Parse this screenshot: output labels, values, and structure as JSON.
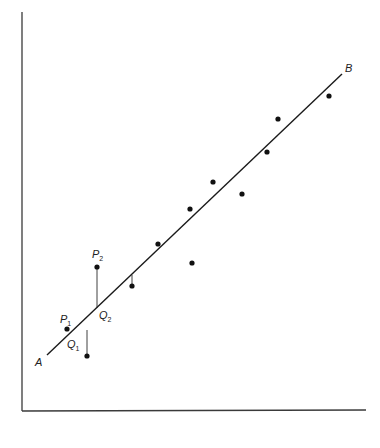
{
  "diagram": {
    "type": "scatter-with-regression-line",
    "axes": {
      "origin": [
        22,
        411
      ],
      "y_top": [
        22,
        12
      ],
      "x_right": [
        366,
        411
      ]
    },
    "line": {
      "start": {
        "label": "A",
        "x": 47,
        "y": 355
      },
      "end": {
        "label": "B",
        "x": 342,
        "y": 74
      }
    },
    "labels": {
      "A": "A",
      "B": "B",
      "P1": {
        "main": "P",
        "sub": "1"
      },
      "P2": {
        "main": "P",
        "sub": "2"
      },
      "Q1": {
        "main": "Q",
        "sub": "1"
      },
      "Q2": {
        "main": "Q",
        "sub": "2"
      }
    },
    "points": [
      {
        "name": "P1",
        "x": 67,
        "y": 329
      },
      {
        "name": "below-Q1",
        "x": 87,
        "y": 356
      },
      {
        "name": "P2",
        "x": 97,
        "y": 267
      },
      {
        "name": "pt-4",
        "x": 132,
        "y": 286
      },
      {
        "name": "pt-5",
        "x": 158,
        "y": 244
      },
      {
        "name": "pt-6",
        "x": 190,
        "y": 209
      },
      {
        "name": "pt-7",
        "x": 192,
        "y": 263
      },
      {
        "name": "pt-8",
        "x": 213,
        "y": 182
      },
      {
        "name": "pt-9",
        "x": 242,
        "y": 194
      },
      {
        "name": "pt-10",
        "x": 267,
        "y": 152
      },
      {
        "name": "pt-11",
        "x": 278,
        "y": 119
      },
      {
        "name": "pt-12",
        "x": 329,
        "y": 96
      }
    ],
    "residual_segments": [
      {
        "name": "Q1-residual",
        "x1": 87,
        "y1": 330,
        "x2": 87,
        "y2": 356
      },
      {
        "name": "P2-Q2-residual",
        "x1": 97,
        "y1": 267,
        "x2": 97,
        "y2": 308
      },
      {
        "name": "pt-4-residual",
        "x1": 132,
        "y1": 275,
        "x2": 132,
        "y2": 286
      }
    ]
  }
}
